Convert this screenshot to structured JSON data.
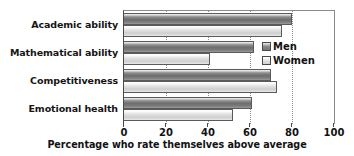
{
  "chart_data": {
    "type": "bar",
    "orientation": "horizontal",
    "title": "",
    "xlabel": "Percentage who rate themselves above average",
    "ylabel": "",
    "xlim": [
      0,
      100
    ],
    "xticks": [
      0,
      20,
      40,
      60,
      80,
      100
    ],
    "xtick_labels": [
      "0",
      "20",
      "40",
      "60",
      "80",
      "100"
    ],
    "grid": "vertical dotted gridlines at 20, 40, 60, 80",
    "legend_position": "inside right, upper-middle",
    "categories": [
      "Academic ability",
      "Mathematical ability",
      "Competitiveness",
      "Emotional health"
    ],
    "series": [
      {
        "name": "Men",
        "color": "#7c7c7c",
        "values": [
          80,
          62,
          70,
          61
        ]
      },
      {
        "name": "Women",
        "color": "#dcdcdc",
        "values": [
          75,
          41,
          73,
          52
        ]
      }
    ]
  },
  "legend": {
    "items": [
      {
        "label": "Men",
        "key": "men"
      },
      {
        "label": "Women",
        "key": "women"
      }
    ]
  },
  "axis": {
    "title": "Percentage who rate themselves above average",
    "tick_labels": [
      "0",
      "20",
      "40",
      "60",
      "80",
      "100"
    ]
  },
  "categories": [
    "Academic ability",
    "Mathematical ability",
    "Competitiveness",
    "Emotional health"
  ]
}
